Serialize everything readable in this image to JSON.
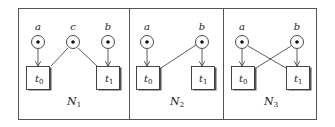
{
  "figure": {
    "colors": {
      "stroke": "#333333",
      "background": "#ffffff"
    },
    "nets": [
      {
        "name": "N",
        "name_sub": "1",
        "places": [
          {
            "label": "a",
            "tokens": 1
          },
          {
            "label": "c",
            "tokens": 1
          },
          {
            "label": "b",
            "tokens": 1
          }
        ],
        "transitions": [
          {
            "label": "t",
            "sub": "0"
          },
          {
            "label": "t",
            "sub": "1"
          }
        ],
        "arcs": [
          [
            "a",
            "t0"
          ],
          [
            "c",
            "t0"
          ],
          [
            "c",
            "t1"
          ],
          [
            "b",
            "t1"
          ]
        ]
      },
      {
        "name": "N",
        "name_sub": "2",
        "places": [
          {
            "label": "a",
            "tokens": 1
          },
          {
            "label": "b",
            "tokens": 1
          }
        ],
        "transitions": [
          {
            "label": "t",
            "sub": "0"
          },
          {
            "label": "t",
            "sub": "1"
          }
        ],
        "arcs": [
          [
            "a",
            "t0"
          ],
          [
            "b",
            "t0"
          ],
          [
            "b",
            "t1"
          ]
        ]
      },
      {
        "name": "N",
        "name_sub": "3",
        "places": [
          {
            "label": "a",
            "tokens": 1
          },
          {
            "label": "b",
            "tokens": 1
          }
        ],
        "transitions": [
          {
            "label": "t",
            "sub": "0"
          },
          {
            "label": "t",
            "sub": "1"
          }
        ],
        "arcs": [
          [
            "a",
            "t0"
          ],
          [
            "a",
            "t1"
          ],
          [
            "b",
            "t0"
          ],
          [
            "b",
            "t1"
          ]
        ]
      }
    ]
  }
}
